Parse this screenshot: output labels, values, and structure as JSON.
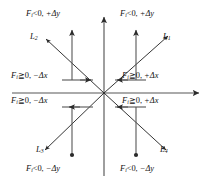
{
  "figure": {
    "type": "quadrant-diagram",
    "axes": {
      "origin": {
        "x": 104,
        "y": 93
      },
      "x_axis": {
        "from_x": 12,
        "to_x": 200,
        "y": 93,
        "arrow": "right"
      },
      "y_axis": {
        "x": 104,
        "from_y": 176,
        "to_y": 16,
        "arrow": "up"
      }
    },
    "diagonals": [
      {
        "name": "L1",
        "quadrant": "upper-right",
        "arrow_end": "outward",
        "angle_deg": 45
      },
      {
        "name": "L2",
        "quadrant": "upper-left",
        "arrow_end": "outward",
        "angle_deg": 135
      },
      {
        "name": "L3",
        "quadrant": "lower-left",
        "arrow_end": "outward",
        "angle_deg": 225
      },
      {
        "name": "L4",
        "quadrant": "lower-right",
        "arrow_end": "outward",
        "angle_deg": 315
      }
    ]
  },
  "line_labels": [
    {
      "id": "L1",
      "letter": "L",
      "index": "1"
    },
    {
      "id": "L2",
      "letter": "L",
      "index": "2"
    },
    {
      "id": "L3",
      "letter": "L",
      "index": "3"
    },
    {
      "id": "L4",
      "letter": "L",
      "index": "4"
    }
  ],
  "conditions": {
    "top_left": {
      "force": "F",
      "sub": "i",
      "relation": "<0",
      "comma": ", ",
      "delta": "+Δy"
    },
    "top_right": {
      "force": "F",
      "sub": "i",
      "relation": "<0",
      "comma": ", ",
      "delta": "+Δy"
    },
    "mid_left_up": {
      "force": "F",
      "sub": "i",
      "relation": "≧0",
      "comma": ", ",
      "delta": "−Δx"
    },
    "mid_right_up": {
      "force": "F",
      "sub": "i",
      "relation": "≧0",
      "comma": ", ",
      "delta": "+Δx"
    },
    "mid_left_dn": {
      "force": "F",
      "sub": "i",
      "relation": "≧0",
      "comma": ", ",
      "delta": "−Δx"
    },
    "mid_right_dn": {
      "force": "F",
      "sub": "i",
      "relation": "≧0",
      "comma": ", ",
      "delta": "+Δx"
    },
    "bottom_left": {
      "force": "F",
      "sub": "i",
      "relation": "<0",
      "comma": ", ",
      "delta": "−Δy"
    },
    "bottom_right": {
      "force": "F",
      "sub": "i",
      "relation": "<0",
      "comma": ", ",
      "delta": "−Δy"
    }
  },
  "colors": {
    "stroke": "#2a2a2a",
    "axis": "#4a4a4a",
    "text": "#121212",
    "background": "#ffffff"
  }
}
